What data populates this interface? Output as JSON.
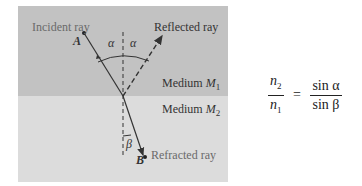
{
  "diagram": {
    "labels": {
      "incident_ray": "Incident ray",
      "reflected_ray": "Reflected ray",
      "refracted_ray": "Refracted ray",
      "point_a": "A",
      "point_b": "B",
      "angle_alpha_left": "α",
      "angle_alpha_right": "α",
      "angle_beta": "β",
      "medium_1": "Medium ",
      "medium_1_sym": "M",
      "medium_1_sub": "1",
      "medium_2": "Medium ",
      "medium_2_sym": "M",
      "medium_2_sub": "2"
    },
    "colors": {
      "medium_1_bg": "#c2c2c2",
      "medium_2_bg": "#dcdcdc",
      "line": "#333333"
    }
  },
  "formula": {
    "lhs_num": "n",
    "lhs_num_sub": "2",
    "lhs_den": "n",
    "lhs_den_sub": "1",
    "equals": "=",
    "rhs_num": "sin α",
    "rhs_den": "sin β"
  }
}
